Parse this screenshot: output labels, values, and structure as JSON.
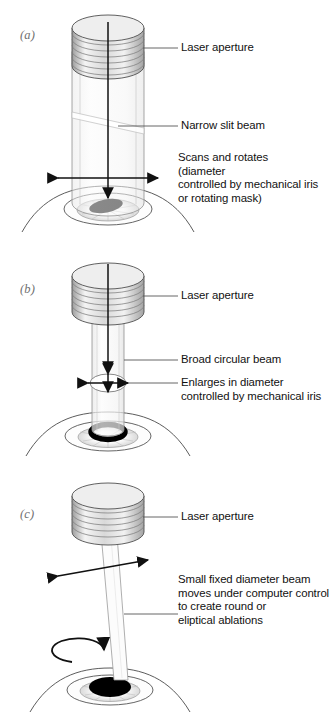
{
  "figure": {
    "background": "#ffffff",
    "ink": "#111111",
    "beam_fill": "#f2f2f2",
    "metal_light": "#f6f6f6",
    "metal_dark": "#b9b9b9",
    "ablation_color": "#000000"
  },
  "panels": [
    {
      "id": "a",
      "label": "(a)",
      "aperture_label": "Laser aperture",
      "beam_label": "Narrow slit beam",
      "note": "Scans and rotates\n(diameter\ncontrolled by mechanical iris\nor rotating mask)",
      "ablation_shape": "ellipse-slit",
      "beam_type": "wide-cylinder-with-diagonal-slit"
    },
    {
      "id": "b",
      "label": "(b)",
      "aperture_label": "Laser aperture",
      "beam_label": "Broad circular beam",
      "iris_label": "Enlarges in diameter\ncontrolled by mechanical iris",
      "ablation_shape": "ring",
      "beam_type": "narrow-cylinder-with-iris"
    },
    {
      "id": "c",
      "label": "(c)",
      "aperture_label": "Laser aperture",
      "note": "Small fixed diameter beam\nmoves under computer control\nto create round or\neliptical ablations",
      "ablation_shape": "filled-ellipse",
      "beam_type": "thin-tilted-scanning-beam"
    }
  ]
}
